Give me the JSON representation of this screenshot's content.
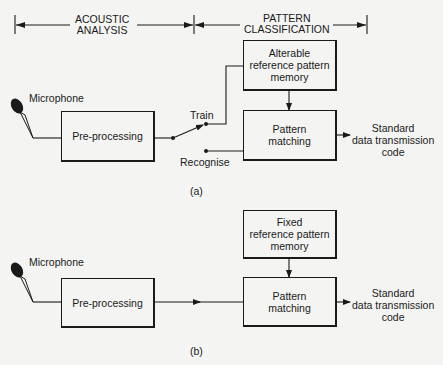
{
  "header": {
    "acoustic_analysis": [
      "ACOUSTIC",
      "ANALYSIS"
    ],
    "pattern_classification": [
      "PATTERN",
      "CLASSIFICATION"
    ]
  },
  "diagram_a": {
    "microphone_label": "Microphone",
    "preprocessing": "Pre-processing",
    "memory": [
      "Alterable",
      "reference pattern",
      "memory"
    ],
    "matching": [
      "Pattern",
      "matching"
    ],
    "switch_train": "Train",
    "switch_recognise": "Recognise",
    "output": [
      "Standard",
      "data transmission",
      "code"
    ],
    "caption": "(a)"
  },
  "diagram_b": {
    "microphone_label": "Microphone",
    "preprocessing": "Pre-processing",
    "memory": [
      "Fixed",
      "reference pattern",
      "memory"
    ],
    "matching": [
      "Pattern",
      "matching"
    ],
    "output": [
      "Standard",
      "data transmission",
      "code"
    ],
    "caption": "(b)"
  }
}
